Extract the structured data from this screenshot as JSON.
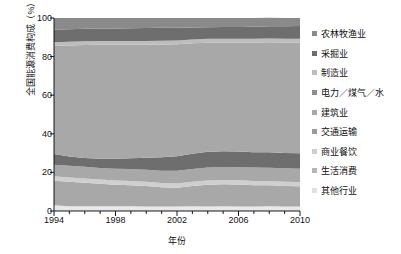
{
  "chart_data": {
    "type": "area",
    "title": "",
    "subtitle": "",
    "xlabel": "年份",
    "ylabel": "全国能源消费构成（%）",
    "xlim": [
      1994,
      2010
    ],
    "ylim": [
      0,
      100
    ],
    "xticks": [
      "1994",
      "1998",
      "2002",
      "2006",
      "2010"
    ],
    "xtick_values": [
      1994,
      1998,
      2002,
      2006,
      2010
    ],
    "yticks": [
      "0",
      "20",
      "40",
      "60",
      "80",
      "100"
    ],
    "ytick_values": [
      0,
      20,
      40,
      60,
      80,
      100
    ],
    "minor_tick_interval": 1,
    "grid": false,
    "stacked": true,
    "legend_position": "right",
    "x": [
      1994,
      1995,
      1996,
      1997,
      1998,
      1999,
      2000,
      2001,
      2002,
      2003,
      2004,
      2005,
      2006,
      2007,
      2008,
      2009,
      2010
    ],
    "series": [
      {
        "name": "农林牧渔业",
        "color": "#8a8a8a",
        "values": [
          6.0,
          5.8,
          5.6,
          5.5,
          5.4,
          5.3,
          5.2,
          5.1,
          5.0,
          4.9,
          4.8,
          4.7,
          4.6,
          4.5,
          4.4,
          4.3,
          4.2
        ]
      },
      {
        "name": "采掘业",
        "color": "#6e6e6e",
        "values": [
          6.5,
          6.5,
          6.4,
          6.4,
          6.5,
          6.6,
          6.7,
          6.7,
          6.6,
          6.2,
          6.0,
          6.0,
          6.1,
          6.2,
          6.3,
          6.4,
          6.5
        ]
      },
      {
        "name": "制造业",
        "color": "#bdbdbd",
        "values": [
          2.0,
          2.0,
          2.0,
          2.0,
          2.0,
          2.0,
          2.0,
          2.0,
          2.0,
          2.0,
          2.0,
          2.0,
          2.0,
          2.0,
          2.0,
          2.0,
          2.0
        ]
      },
      {
        "name": "电力／煤气／水",
        "color": "#a8a8a8",
        "values": [
          56.0,
          57.5,
          58.5,
          59.0,
          59.0,
          58.8,
          58.5,
          58.3,
          58.0,
          57.2,
          56.5,
          56.3,
          56.5,
          56.8,
          57.0,
          57.2,
          57.4
        ]
      },
      {
        "name": "建筑业",
        "color": "#6e6e6e",
        "values": [
          5.5,
          4.8,
          4.6,
          4.8,
          5.2,
          5.6,
          6.2,
          7.0,
          7.6,
          8.0,
          8.2,
          8.2,
          8.1,
          8.0,
          8.0,
          8.0,
          8.0
        ]
      },
      {
        "name": "交通运输",
        "color": "#a8a8a8",
        "values": [
          6.0,
          6.0,
          6.0,
          6.0,
          6.1,
          6.2,
          6.3,
          6.4,
          6.5,
          6.6,
          6.7,
          6.8,
          6.8,
          6.9,
          6.9,
          6.9,
          6.9
        ]
      },
      {
        "name": "商业餐饮",
        "color": "#cfcfcf",
        "values": [
          2.3,
          2.2,
          2.2,
          2.2,
          2.2,
          2.2,
          2.2,
          2.2,
          2.2,
          2.2,
          2.2,
          2.2,
          2.2,
          2.2,
          2.2,
          2.2,
          2.2
        ]
      },
      {
        "name": "生活消费",
        "color": "#a8a8a8",
        "values": [
          12.7,
          12.7,
          12.2,
          11.6,
          11.2,
          10.9,
          10.6,
          10.0,
          9.8,
          10.5,
          11.3,
          11.4,
          11.4,
          11.1,
          10.9,
          10.7,
          10.5
        ]
      },
      {
        "name": "其他行业",
        "color": "#e8e8e8",
        "values": [
          3.0,
          2.5,
          2.5,
          2.5,
          2.4,
          2.4,
          2.3,
          2.3,
          2.3,
          2.4,
          2.3,
          2.4,
          2.3,
          2.3,
          2.4,
          2.3,
          2.3
        ]
      }
    ]
  },
  "axis": {
    "y_title": "全国能源消费构成（%）",
    "x_title": "年份"
  },
  "legend": {
    "items": [
      {
        "label": "农林牧渔业",
        "color": "#8a8a8a"
      },
      {
        "label": "采掘业",
        "color": "#6e6e6e"
      },
      {
        "label": "制造业",
        "color": "#bdbdbd"
      },
      {
        "label": "电力／煤气／水",
        "color": "#8f8f8f"
      },
      {
        "label": "建筑业",
        "color": "#a8a8a8"
      },
      {
        "label": "交通运输",
        "color": "#9a9a9a"
      },
      {
        "label": "商业餐饮",
        "color": "#cfcfcf"
      },
      {
        "label": "生活消费",
        "color": "#b5b5b5"
      },
      {
        "label": "其他行业",
        "color": "#e0e0e0"
      }
    ]
  }
}
